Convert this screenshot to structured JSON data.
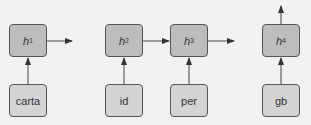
{
  "hidden_nodes": [
    {
      "label": "h",
      "sub": "1"
    },
    {
      "label": "h",
      "sub": "2"
    },
    {
      "label": "h",
      "sub": "3"
    },
    {
      "label": "h",
      "sub": "4"
    }
  ],
  "input_nodes": [
    {
      "label": "carta"
    },
    {
      "label": "id"
    },
    {
      "label": "per"
    },
    {
      "label": "gb"
    }
  ],
  "colors": {
    "hidden_fill": "#bdbdbd",
    "input_fill": "#d4d4d4",
    "stroke": "#555555",
    "arrow": "#333333"
  }
}
